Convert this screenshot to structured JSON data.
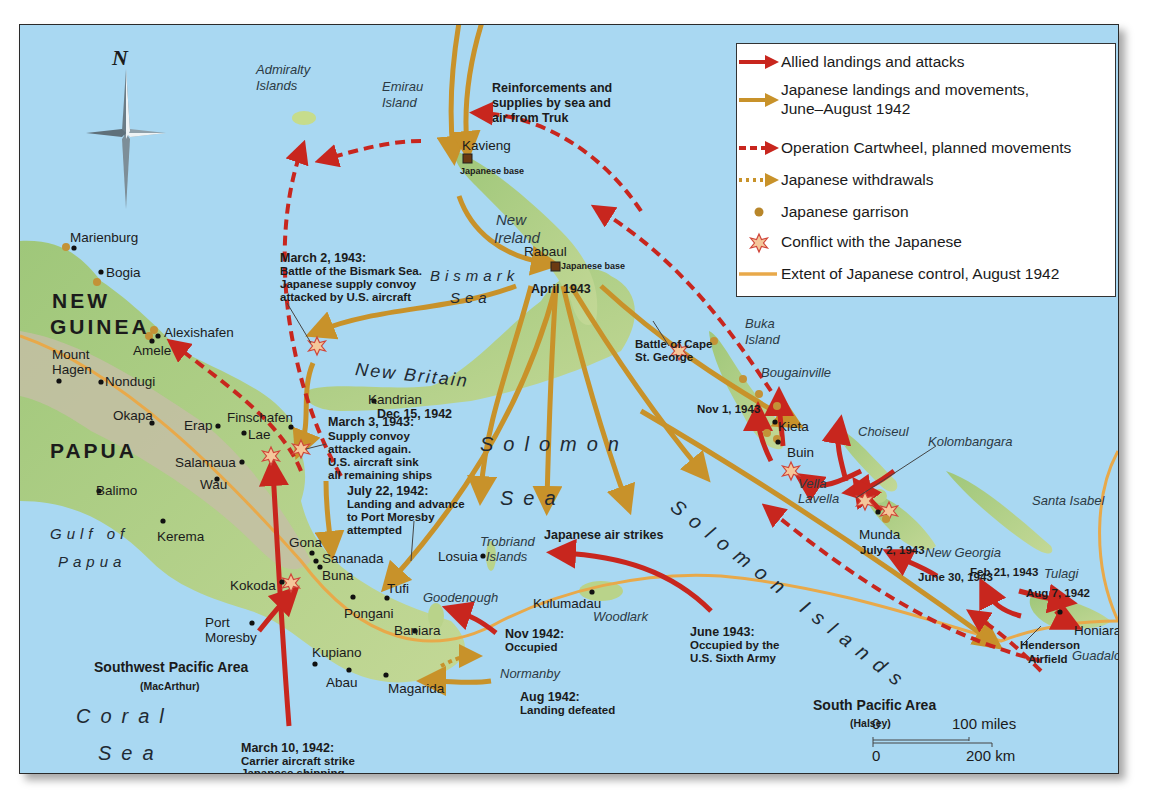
{
  "legend": {
    "items": [
      {
        "symbol": "solid-red-arrow",
        "label": "Allied landings and attacks",
        "color": "#c8261e"
      },
      {
        "symbol": "solid-gold-arrow",
        "label": "Japanese landings and movements,",
        "label2": "June–August 1942",
        "color": "#c8922a"
      },
      {
        "symbol": "dashed-red-arrow",
        "label": "Operation Cartwheel, planned movements",
        "color": "#c8261e"
      },
      {
        "symbol": "dotted-gold-arrow",
        "label": "Japanese withdrawals",
        "color": "#c8922a"
      },
      {
        "symbol": "garrison-dot",
        "label": "Japanese garrison",
        "color": "#b8862a"
      },
      {
        "symbol": "conflict-star",
        "label": "Conflict with the Japanese",
        "color": "#e06a3a"
      },
      {
        "symbol": "control-line",
        "label": "Extent of Japanese control,  August 1942",
        "color": "#e8a94a"
      }
    ]
  },
  "compass": {
    "label": "N"
  },
  "regions": {
    "new_guinea_1": "NEW",
    "new_guinea_2": "GUINEA",
    "papua": "PAPUA"
  },
  "seas": {
    "solomon_sea_1": "Solomon",
    "solomon_sea_2": "Sea",
    "coral_1": "Coral",
    "coral_2": "Sea",
    "bismark_1": "Bismark",
    "bismark_2": "Sea",
    "gulf_1": "Gulf of",
    "gulf_2": "Papua",
    "solomon_islands": "Solomon Islands"
  },
  "islands": {
    "admiralty_1": "Admiralty",
    "admiralty_2": "Islands",
    "emirau_1": "Emirau",
    "emirau_2": "Island",
    "new_ireland_1": "New",
    "new_ireland_2": "Ireland",
    "new_britain": "New Britain",
    "buka_1": "Buka",
    "buka_2": "Island",
    "bougainville": "Bougainville",
    "choiseul": "Choiseul",
    "kolombangara": "Kolombangara",
    "vella_1": "Vella",
    "vella_2": "Lavella",
    "santa_isabel": "Santa Isabel",
    "new_georgia": "New Georgia",
    "tulagi": "Tulagi",
    "guadalcanal": "Guadalcanal",
    "trobriand_1": "Trobriand",
    "trobriand_2": "Islands",
    "goodenough": "Goodenough",
    "woodlark": "Woodlark",
    "normanby": "Normanby"
  },
  "places": {
    "marienburg": "Marienburg",
    "bogia": "Bogia",
    "alexishafen": "Alexishafen",
    "amele": "Amele",
    "mount_hagen_1": "Mount",
    "mount_hagen_2": "Hagen",
    "nondugi": "Nondugi",
    "okapa": "Okapa",
    "erap": "Erap",
    "finschafen": "Finschafen",
    "lae": "Lae",
    "salamaua": "Salamaua",
    "wau": "Wau",
    "balimo": "Balimo",
    "kerema": "Kerema",
    "gona": "Gona",
    "sananada": "Sananada",
    "buna": "Buna",
    "kokoda": "Kokoda",
    "tufi": "Tufi",
    "pongani": "Pongani",
    "baniara": "Baniara",
    "port_moresby_1": "Port",
    "port_moresby_2": "Moresby",
    "kupiano": "Kupiano",
    "abau": "Abau",
    "magarida": "Magarida",
    "losuia": "Losuia",
    "kulumadau": "Kulumadau",
    "kavieng": "Kavieng",
    "rabaul": "Rabaul",
    "kandrian": "Kandrian",
    "kieta": "Kieta",
    "buin": "Buin",
    "munda": "Munda",
    "honiara": "Honiara",
    "henderson_1": "Henderson",
    "henderson_2": "Airfield"
  },
  "annotations": {
    "truk_1": "Reinforcements and",
    "truk_2": "supplies by sea and",
    "truk_3": "air from Truk",
    "kavieng_base": "Japanese base",
    "rabaul_base": "Japanese base",
    "rabaul_date": "April 1943",
    "kandrian_date": "Dec 15, 1942",
    "bismark_battle_h": "March 2, 1943:",
    "bismark_battle_1": "Battle of the Bismark Sea.",
    "bismark_battle_2": "Japanese supply convoy",
    "bismark_battle_3": "attacked by U.S. aircraft",
    "convoy_h": "March 3, 1943:",
    "convoy_1": "Supply convoy",
    "convoy_2": "attacked again.",
    "convoy_3": "U.S. aircraft sink",
    "convoy_4": "all remaining ships",
    "july_h": "July 22, 1942:",
    "july_1": "Landing and advance",
    "july_2": "to Port Moresby",
    "july_3": "attempted",
    "air_strikes": "Japanese air strikes",
    "cape_1": "Battle of Cape",
    "cape_2": "St. George",
    "nov1943": "Nov 1, 1943",
    "july2": "July 2, 1943",
    "june30": "June 30, 1943",
    "feb21": "Feb 21, 1943",
    "aug7": "Aug 7, 1942",
    "nov1942_h": "Nov 1942:",
    "nov1942_1": "Occupied",
    "june1943_h": "June 1943:",
    "june1943_1": "Occupied by the",
    "june1943_2": "U.S. Sixth Army",
    "aug1942_h": "Aug 1942:",
    "aug1942_1": "Landing defeated",
    "march10_h": "March 10, 1942:",
    "march10_1": "Carrier aircraft strike",
    "march10_2": "Japanese shipping",
    "swpa": "Southwest Pacific Area",
    "swpa_sub": "(MacArthur)",
    "spa": "South Pacific Area",
    "spa_sub": "(Halsey)"
  },
  "scale": {
    "zero": "0",
    "miles": "100 miles",
    "km": "200 km"
  },
  "colors": {
    "ocean": "#a9d8f2",
    "land": "#b9d38a",
    "highland": "#c9c0a8",
    "allied": "#c8261e",
    "japanese": "#c8922a",
    "control": "#e8a94a"
  }
}
